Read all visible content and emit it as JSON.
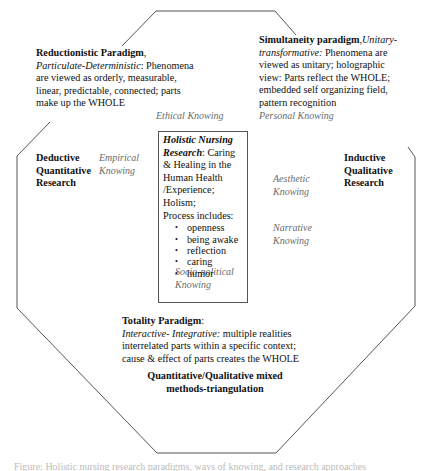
{
  "diagram": {
    "title_center": {
      "heading": "Holistic Nursing Research",
      "heading_suffix": ": Caring & Healing in the Human Health /Experience; Holism;",
      "process_label": "Process includes:",
      "process_items": [
        "openness",
        "being awake",
        "reflection",
        "caring",
        "humor"
      ]
    },
    "reductionistic": {
      "name": "Reductionistic Paradigm",
      "subtitle": ", Particulate-Deterministic",
      "description": ": Phenomena are viewed as orderly, measurable, linear, predictable, connected; parts make up the WHOLE"
    },
    "simultaneity": {
      "name": "Simultaneity paradigm",
      "subtitle": ",Unitary-transformative:",
      "description": " Phenomena are viewed as unitary; holographic view: Parts reflect the WHOLE; embedded self organizing field, pattern recognition"
    },
    "totality": {
      "name": "Totality Paradigm",
      "colon": ":",
      "subtitle": "Interactive- Integrative:",
      "description": " multiple realities interrelated parts within a specific context; cause & effect of parts creates the WHOLE"
    },
    "deductive": "Deductive Quantitative Research",
    "inductive": "Inductive Qualitative Research",
    "mixed_methods": "Quantitative/Qualitative mixed methods-triangulation",
    "knowings": {
      "ethical": "Ethical Knowing",
      "personal": "Personal Knowing",
      "empirical": "Empirical Knowing",
      "aesthetic": "Aesthetic Knowing",
      "narrative": "Narrative Knowing",
      "sociopolitical": "Socio-political Knowing"
    },
    "caption_partial": "Figure: Holistic nursing research paradigms, ways of knowing, and research approaches"
  }
}
